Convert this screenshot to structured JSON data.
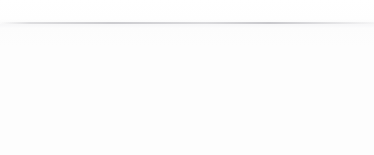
{
  "diagram": {
    "type": "finite-state-automaton",
    "title": "",
    "canvas": {
      "width": 374,
      "height": 155
    },
    "palette": {
      "background": "#fdfdfd",
      "stroke": "#72727a",
      "label_text": "#4a4a52",
      "arrowhead": "#5e5e66"
    },
    "start_marker": {
      "name": "start-arrow",
      "from_x": 2,
      "to_x": 40,
      "y": 46,
      "target_state": "sigma-0"
    },
    "states": [
      {
        "id": "sigma-0",
        "label": "σ",
        "subscript": "0",
        "cx": 52,
        "cy": 46,
        "r": 12,
        "accepting": false
      },
      {
        "id": "sigma-1",
        "label": "σ",
        "subscript": "1",
        "cx": 149,
        "cy": 46,
        "r": 12,
        "accepting": false
      },
      {
        "id": "sigma-2",
        "label": "σ",
        "subscript": "2",
        "cx": 245,
        "cy": 46,
        "r": 12,
        "accepting": false
      },
      {
        "id": "sigma-3",
        "label": "σ",
        "subscript": "3",
        "cx": 337,
        "cy": 46,
        "r": 14,
        "inner_r": 10.5,
        "accepting": true
      },
      {
        "id": "sigma-4",
        "label": "σ",
        "subscript": "4",
        "cx": 200,
        "cy": 136,
        "r": 12,
        "accepting": false
      }
    ],
    "transitions": [
      {
        "id": "t0",
        "from": "sigma-0",
        "to": "sigma-1",
        "symbol": "a",
        "label_x": 97,
        "label_y": 37,
        "kind": "straight"
      },
      {
        "id": "t1",
        "from": "sigma-1",
        "to": "sigma-2",
        "symbol": "b",
        "label_x": 197,
        "label_y": 37,
        "kind": "straight"
      },
      {
        "id": "t2",
        "from": "sigma-2",
        "to": "sigma-3",
        "symbol": "b",
        "label_x": 294,
        "label_y": 37,
        "kind": "straight"
      },
      {
        "id": "t3",
        "from": "sigma-0",
        "to": "sigma-4",
        "symbol": "b",
        "label_x": 110,
        "label_y": 95,
        "kind": "diagonal"
      },
      {
        "id": "t4",
        "from": "sigma-4",
        "to": "sigma-3",
        "symbol": "a",
        "label_x": 278,
        "label_y": 97,
        "kind": "diagonal"
      },
      {
        "id": "t5",
        "from": "sigma-3",
        "to": "sigma-3",
        "symbol": "a",
        "label_x": 366,
        "label_y": 4,
        "kind": "self-loop-upper"
      },
      {
        "id": "t6",
        "from": "sigma-3",
        "to": "sigma-3",
        "symbol": "b",
        "label_x": 367,
        "label_y": 89,
        "kind": "self-loop-lower"
      }
    ],
    "alphabet": [
      "a",
      "b"
    ],
    "start_state": "sigma-0",
    "accepting_states": [
      "sigma-3"
    ]
  }
}
